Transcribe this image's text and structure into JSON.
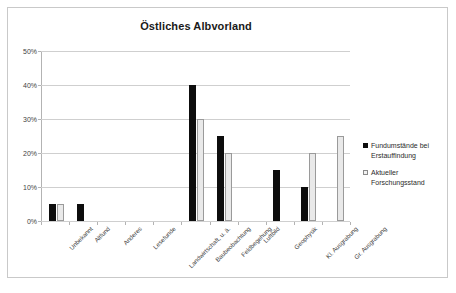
{
  "chart_data": {
    "type": "bar",
    "title": "Östliches Albvorland",
    "xlabel": "",
    "ylabel": "",
    "ylim": [
      0,
      50
    ],
    "ytick_labels": [
      "0%",
      "10%",
      "20%",
      "30%",
      "40%",
      "50%"
    ],
    "ytick_values": [
      0,
      10,
      20,
      30,
      40,
      50
    ],
    "grid": true,
    "legend_position": "right",
    "categories": [
      "Unbekannt",
      "Altfund",
      "Anderes",
      "Lesefunde",
      "Landwirtschaft, u. ä.",
      "Baubeobachtung",
      "Feldbegehung",
      "Luftbild",
      "Geophysik",
      "Kl. Ausgrabung",
      "Gr. Ausgrabung"
    ],
    "series": [
      {
        "name": "Fundumstände bei Erstauffindung",
        "color": "#0d0d0d",
        "values": [
          5,
          5,
          0,
          0,
          0,
          40,
          25,
          0,
          15,
          10,
          0
        ]
      },
      {
        "name": "Aktueller Forschungsstand",
        "color": "#e9e9e9",
        "values": [
          5,
          0,
          0,
          0,
          0,
          30,
          20,
          0,
          0,
          20,
          25
        ]
      }
    ]
  },
  "legend": {
    "entries": [
      {
        "label": "Fundumstände bei Erstauffindung"
      },
      {
        "label": "Aktueller Forschungsstand"
      }
    ]
  }
}
